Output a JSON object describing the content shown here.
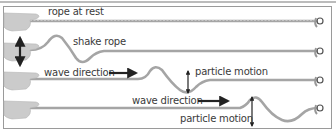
{
  "diagram": {
    "labels": {
      "rope_at_rest": "rope at rest",
      "shake_rope": "shake rope",
      "wave_direction_1": "wave direction",
      "particle_motion_1": "particle motion",
      "wave_direction_2": "wave direction",
      "particle_motion_2": "particle motion"
    },
    "rows": [
      {
        "name": "rope-at-rest",
        "stage": 1
      },
      {
        "name": "shake-rope",
        "stage": 2
      },
      {
        "name": "wave-travelling-1",
        "stage": 3
      },
      {
        "name": "wave-travelling-2",
        "stage": 4
      }
    ],
    "colors": {
      "rope": "#a9a9a9",
      "rope_highlight": "#cfcfcf",
      "hand": "#c8c8c8",
      "arrow": "#222222",
      "text": "#3a3a3a",
      "border": "#8a8a8a"
    }
  }
}
